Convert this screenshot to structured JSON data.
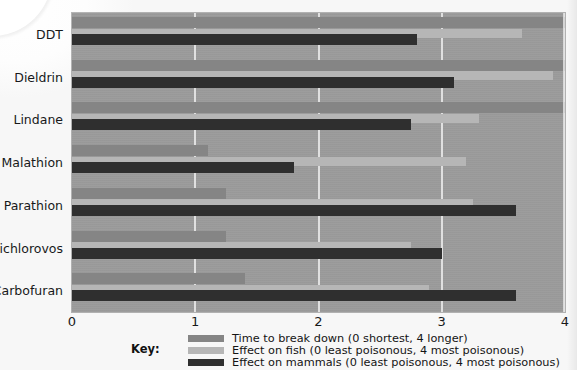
{
  "chart_data": {
    "type": "bar",
    "orientation": "horizontal",
    "title": "",
    "xlabel": "",
    "ylabel": "",
    "xlim": [
      0,
      4
    ],
    "xticks": [
      "0",
      "1",
      "2",
      "3",
      "4"
    ],
    "grid": true,
    "legend_position": "bottom",
    "legend_title": "Key:",
    "categories": [
      "DDT",
      "Dieldrin",
      "Lindane",
      "Malathion",
      "Parathion",
      "Dichlorovos",
      "Carbofuran"
    ],
    "series": [
      {
        "name": "Time to break down (0 shortest, 4 longer)",
        "key": "time",
        "color": "#858585",
        "values": [
          4.0,
          4.0,
          4.0,
          1.1,
          1.25,
          1.25,
          1.4
        ]
      },
      {
        "name": "Effect on fish (0 least poisonous, 4 most poisonous)",
        "key": "fish",
        "color": "#b6b6b6",
        "values": [
          3.65,
          3.9,
          3.3,
          3.2,
          3.25,
          2.75,
          2.9
        ]
      },
      {
        "name": "Effect on mammals (0 least poisonous, 4 most poisonous)",
        "key": "mammals",
        "color": "#2f2f2f",
        "values": [
          2.8,
          3.1,
          2.75,
          1.8,
          3.6,
          3.0,
          3.6
        ]
      }
    ]
  },
  "plot": {
    "background_color": "#9b9b9b",
    "gridline_color": "#e8e8e8"
  }
}
